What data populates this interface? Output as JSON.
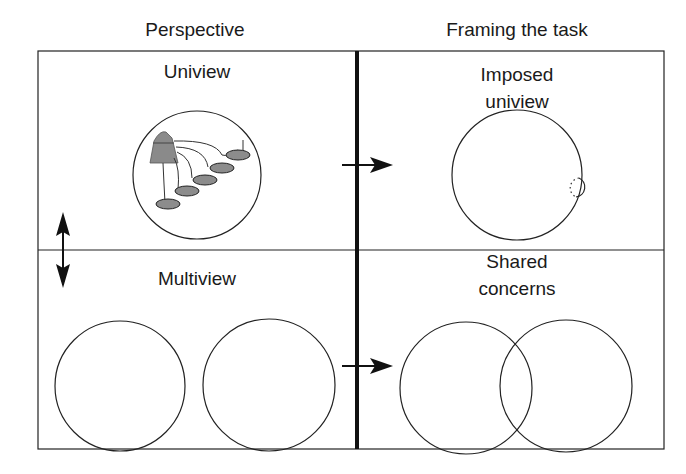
{
  "columns": {
    "left_header": "Perspective",
    "right_header": "Framing the task"
  },
  "cells": {
    "top_left": {
      "label": "Uniview"
    },
    "top_right": {
      "label": "Imposed\nuniview"
    },
    "bottom_left": {
      "label": "Multiview"
    },
    "bottom_right": {
      "label": "Shared\nconcerns"
    }
  },
  "colors": {
    "stroke": "#1a1a1a",
    "fill_gray": "#8c8c8c",
    "mountain": "#8a8a8a"
  }
}
